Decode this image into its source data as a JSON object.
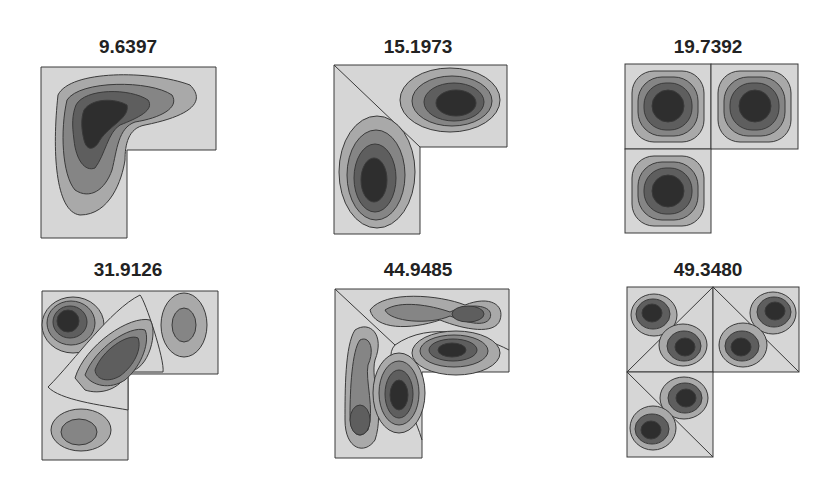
{
  "figure": {
    "colors": {
      "level0": "#d6d6d6",
      "level1": "#a9a9a9",
      "level2": "#858585",
      "level3": "#5e5e5e",
      "level4": "#2e2e2e",
      "contour_line": "#3a3a3a",
      "background": "#ffffff"
    },
    "panels": [
      {
        "label": "9.6397",
        "mode": 1
      },
      {
        "label": "15.1973",
        "mode": 2
      },
      {
        "label": "19.7392",
        "mode": 3
      },
      {
        "label": "31.9126",
        "mode": 4
      },
      {
        "label": "44.9485",
        "mode": 5
      },
      {
        "label": "49.3480",
        "mode": 6
      }
    ]
  }
}
